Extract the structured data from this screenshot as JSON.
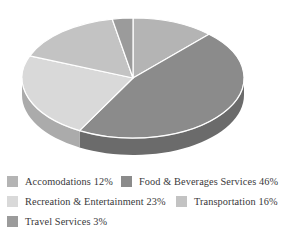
{
  "chart_data": {
    "type": "pie",
    "title": "",
    "subtitle": "",
    "xlabel": "",
    "ylabel": "",
    "legend_position": "bottom",
    "three_d": true,
    "categories": [
      "Accomodations",
      "Food & Beverages Services",
      "Recreation & Entertainment",
      "Transportation",
      "Travel Services"
    ],
    "values": [
      12,
      46,
      23,
      16,
      3
    ],
    "value_unit": "%",
    "colors": [
      "#b4b4b4",
      "#8b8b8b",
      "#d9d9d9",
      "#c3c3c3",
      "#9b9b9b"
    ],
    "slices": [
      {
        "label": "Accomodations",
        "value": 12,
        "display": "Accomodations 12%",
        "color": "#b4b4b4",
        "side_color": "#8e8e8e"
      },
      {
        "label": "Food & Beverages Services",
        "value": 46,
        "display": "Food & Beverages Services 46%",
        "color": "#8b8b8b",
        "side_color": "#6b6b6b"
      },
      {
        "label": "Recreation & Entertainment",
        "value": 23,
        "display": "Recreation & Entertainment 23%",
        "color": "#d9d9d9",
        "side_color": "#ababab"
      },
      {
        "label": "Transportation",
        "value": 16,
        "display": "Transportation 16%",
        "color": "#c3c3c3",
        "side_color": "#9a9a9a"
      },
      {
        "label": "Travel Services",
        "value": 3,
        "display": "Travel Services 3%",
        "color": "#9b9b9b",
        "side_color": "#777777"
      }
    ]
  },
  "legend": {
    "rows": [
      {
        "entries": [
          {
            "label": "Accomodations 12%",
            "color": "#b4b4b4"
          },
          {
            "label": "Food & Beverages Services 46%",
            "color": "#8b8b8b"
          }
        ]
      },
      {
        "entries": [
          {
            "label": "Recreation & Entertainment 23%",
            "color": "#d9d9d9"
          },
          {
            "label": "Transportation 16%",
            "color": "#c3c3c3"
          }
        ]
      },
      {
        "entries": [
          {
            "label": "Travel Services 3%",
            "color": "#9b9b9b"
          }
        ]
      }
    ]
  }
}
